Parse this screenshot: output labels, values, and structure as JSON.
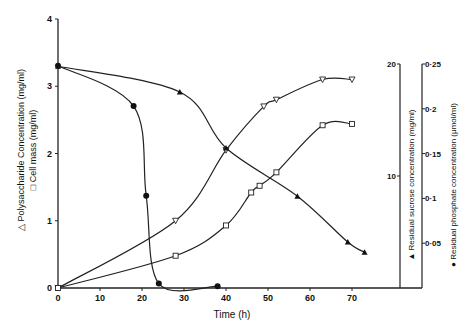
{
  "chart_data": {
    "type": "line",
    "title": "",
    "xlabel": "Time (h)",
    "xlim": [
      0,
      75
    ],
    "x_ticks": [
      "0",
      "10",
      "20",
      "30",
      "40",
      "50",
      "60",
      "70"
    ],
    "grid": false,
    "legend": "axis labels with symbols",
    "axes": {
      "left": {
        "label_lines": [
          "△ Polysaccharide Concentration (mg/ml)",
          "□ Cell mass (mg/ml)"
        ],
        "ylim": [
          0,
          4
        ],
        "ticks": [
          "0",
          "1",
          "2",
          "3",
          "4"
        ]
      },
      "right1": {
        "label": "▲ Residual sucrose concentration (mg/ml)",
        "ylim": [
          0,
          20
        ],
        "ticks": [
          "10",
          "20"
        ]
      },
      "right2": {
        "label": "● Residual phosphate concentration (μmol/ml)",
        "ylim": [
          0,
          0.25
        ],
        "ticks": [
          "0·05",
          "0·1",
          "0·15",
          "0·2",
          "0·25"
        ]
      }
    },
    "series": [
      {
        "name": "Polysaccharide Concentration (mg/ml)",
        "marker": "triangle-down-open",
        "axis": "left",
        "x": [
          0,
          28,
          40,
          49,
          52,
          63,
          70
        ],
        "y": [
          0,
          1.0,
          2.05,
          2.7,
          2.8,
          3.1,
          3.1
        ]
      },
      {
        "name": "Cell mass (mg/ml)",
        "marker": "square-open",
        "axis": "left",
        "x": [
          0,
          28,
          40,
          46,
          48,
          52,
          63,
          70
        ],
        "y": [
          0,
          0.48,
          0.93,
          1.42,
          1.52,
          1.72,
          2.42,
          2.44
        ]
      },
      {
        "name": "Residual sucrose concentration (mg/ml)",
        "marker": "triangle-filled",
        "axis": "right1",
        "x": [
          0,
          29,
          40,
          57,
          69,
          73
        ],
        "y": [
          19.8,
          17.5,
          12.5,
          8.2,
          4.1,
          3.2
        ]
      },
      {
        "name": "Residual phosphate concentration (μmol/ml)",
        "marker": "circle-filled",
        "axis": "right2",
        "x": [
          0,
          18,
          21,
          24,
          38
        ],
        "y": [
          0.248,
          0.203,
          0.103,
          0.005,
          0.002
        ]
      }
    ]
  }
}
